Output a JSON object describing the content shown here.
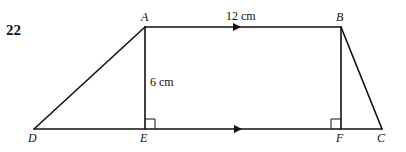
{
  "question": {
    "number": "22"
  },
  "diagram": {
    "shape": "trapezium",
    "vertices": {
      "A": {
        "label": "A",
        "x": 145,
        "y": 27
      },
      "B": {
        "label": "B",
        "x": 341,
        "y": 27
      },
      "C": {
        "label": "C",
        "x": 382,
        "y": 129
      },
      "D": {
        "label": "D",
        "x": 34,
        "y": 129
      },
      "E": {
        "label": "E",
        "x": 145,
        "y": 129
      },
      "F": {
        "label": "F",
        "x": 341,
        "y": 129
      }
    },
    "measurements": {
      "AB": "12 cm",
      "AE": "6 cm"
    },
    "parallel_marks": [
      "AB",
      "DC"
    ],
    "right_angles": [
      "AED",
      "BFC"
    ],
    "line_color": "#111111"
  }
}
